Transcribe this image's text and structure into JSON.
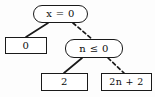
{
  "diagram": {
    "kind": "binary-decision-diagram",
    "background_color": "#fdfdfd",
    "line_color": "#1a1a1a",
    "text_color": "#0d0d0d",
    "nodes": [
      {
        "id": "root",
        "shape": "rounded-rectangle",
        "role": "decision",
        "label": "x = 0"
      },
      {
        "id": "zero",
        "shape": "rectangle",
        "role": "terminal",
        "label": "0"
      },
      {
        "id": "cond",
        "shape": "rounded-rectangle",
        "role": "decision",
        "label": "n ≤ 0"
      },
      {
        "id": "two",
        "shape": "rectangle",
        "role": "terminal",
        "label": "2"
      },
      {
        "id": "linear",
        "shape": "rectangle",
        "role": "terminal",
        "label": "2n + 2"
      }
    ],
    "edges": [
      {
        "id": "root-to-zero",
        "from": "root",
        "to": "zero",
        "style": "solid"
      },
      {
        "id": "root-to-cond",
        "from": "root",
        "to": "cond",
        "style": "dashed"
      },
      {
        "id": "cond-to-two",
        "from": "cond",
        "to": "two",
        "style": "solid"
      },
      {
        "id": "cond-to-linear",
        "from": "cond",
        "to": "linear",
        "style": "dashed"
      }
    ]
  }
}
